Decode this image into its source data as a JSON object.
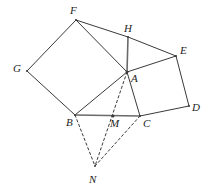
{
  "figure": {
    "background_color": "#ffffff",
    "stroke_color": "#3a3a3a",
    "accent_stroke_color": "#6a6a6a",
    "label_color": "#1d1d1d",
    "width": 209,
    "height": 195,
    "points": [
      {
        "name": "F",
        "label": "F",
        "x": 76,
        "y": 20,
        "label_x": 70,
        "label_y": 5
      },
      {
        "name": "H",
        "label": "H",
        "x": 128,
        "y": 37,
        "label_x": 124,
        "label_y": 23
      },
      {
        "name": "E",
        "label": "E",
        "x": 176,
        "y": 56,
        "label_x": 180,
        "label_y": 45
      },
      {
        "name": "G",
        "label": "G",
        "x": 27,
        "y": 71,
        "label_x": 13,
        "label_y": 63
      },
      {
        "name": "A",
        "label": "A",
        "x": 127,
        "y": 72,
        "label_x": 131,
        "label_y": 73
      },
      {
        "name": "D",
        "label": "D",
        "x": 189,
        "y": 106,
        "label_x": 192,
        "label_y": 102
      },
      {
        "name": "B",
        "label": "B",
        "x": 75,
        "y": 115,
        "label_x": 66,
        "label_y": 117
      },
      {
        "name": "M",
        "label": "M",
        "x": 113,
        "y": 116,
        "label_x": 110,
        "label_y": 118
      },
      {
        "name": "C",
        "label": "C",
        "x": 140,
        "y": 116,
        "label_x": 143,
        "label_y": 118
      },
      {
        "name": "N",
        "label": "N",
        "x": 95,
        "y": 166,
        "label_x": 89,
        "label_y": 174
      }
    ],
    "segments": [
      {
        "name": "segment-F-G",
        "from": "F",
        "to": "G",
        "style": "solid",
        "weight": 1.0
      },
      {
        "name": "segment-G-B",
        "from": "G",
        "to": "B",
        "style": "solid",
        "weight": 1.0
      },
      {
        "name": "segment-B-A",
        "from": "B",
        "to": "A",
        "style": "solid",
        "weight": 1.0
      },
      {
        "name": "segment-A-F",
        "from": "A",
        "to": "F",
        "style": "solid",
        "weight": 1.0
      },
      {
        "name": "segment-F-H",
        "from": "F",
        "to": "H",
        "style": "solid",
        "weight": 1.0
      },
      {
        "name": "segment-H-E",
        "from": "H",
        "to": "E",
        "style": "solid",
        "weight": 1.0
      },
      {
        "name": "segment-H-A",
        "from": "H",
        "to": "A",
        "style": "solid",
        "weight": 1.6
      },
      {
        "name": "segment-E-A",
        "from": "E",
        "to": "A",
        "style": "solid",
        "weight": 1.0
      },
      {
        "name": "segment-E-D",
        "from": "E",
        "to": "D",
        "style": "solid",
        "weight": 1.0
      },
      {
        "name": "segment-D-C",
        "from": "D",
        "to": "C",
        "style": "solid",
        "weight": 1.0
      },
      {
        "name": "segment-C-A",
        "from": "C",
        "to": "A",
        "style": "solid",
        "weight": 1.0
      },
      {
        "name": "segment-B-C",
        "from": "B",
        "to": "C",
        "style": "solid",
        "weight": 1.6
      },
      {
        "name": "segment-A-N",
        "from": "A",
        "to": "N",
        "style": "dashed",
        "weight": 1.0
      },
      {
        "name": "segment-B-N",
        "from": "B",
        "to": "N",
        "style": "dashed",
        "weight": 1.0
      },
      {
        "name": "segment-C-N",
        "from": "C",
        "to": "N",
        "style": "dashed",
        "weight": 1.0
      }
    ]
  }
}
